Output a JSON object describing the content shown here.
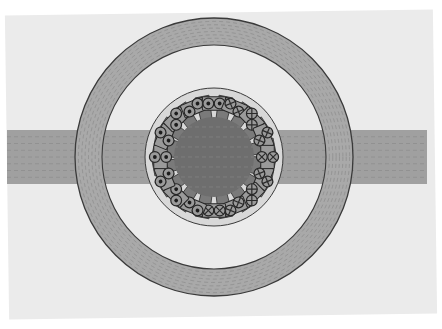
{
  "figure": {
    "subtitle": "Magnetostatic field solution with flux lines",
    "background_color": "#ffffff",
    "panel_color": "#ebebeb",
    "panel_rotation_deg": -0.8
  },
  "colors": {
    "background": "#ffffff",
    "panel": "#ebebeb",
    "stator_yoke": "#a9a9a9",
    "stator_yoke_outline": "#3a3a3a",
    "air_gap": "#f4f4f4",
    "rotor_core": "#6e6e6e",
    "rotor_tooth": "#7a7a7a",
    "rotor_outline": "#3a3a3a",
    "rim": "#d8d8d8",
    "flux_line": "#8a8a8a",
    "conductor_fill": "#9a9a9a",
    "conductor_outline": "#262626",
    "dot_marker": "#1c1c1c",
    "cross_marker": "#2a2a2a",
    "arm": "#a0a0a0"
  },
  "geometry": {
    "center_x": 214,
    "center_y": 157,
    "stator_outer_radius": 139,
    "stator_inner_radius": 112,
    "rim_outer_radius": 69,
    "rim_inner_radius": 63,
    "rotor_core_radius": 40,
    "tooth_outer_radius": 62,
    "tooth_inner_radius": 39,
    "arm_half_height": 27,
    "arm_left_x": 7,
    "arm_right_x": 427
  },
  "slots": {
    "count": 16,
    "angular_pitch_deg": 22.5,
    "start_angle_deg": 11.25,
    "tooth_half_width_deg": 8.2,
    "wide_tooth_indices": [
      0,
      8
    ]
  },
  "windings": {
    "left_side_marker": "current-out-of-page-dot",
    "right_side_marker": "current-into-page-cross",
    "conductors_per_slot": 2,
    "conductor_radius": 5.4,
    "marker_dot_radius": 1.9,
    "legend": {
      "dot_label": "Current out of page",
      "cross_label": "Current into page"
    }
  },
  "flux_lines": {
    "style": "dashed",
    "dash_pattern": "4 3",
    "stroke_width": 0.9,
    "yoke_ring_count": 7,
    "arm_line_count": 7,
    "rotor_line_count": 7,
    "opacity": 0.75
  },
  "labels": {
    "stator": "Stator yoke",
    "rotor": "Rotor core",
    "air_gap": "Air gap",
    "winding": "Armature winding",
    "arm_left": "Left flux arm",
    "arm_right": "Right flux arm"
  }
}
